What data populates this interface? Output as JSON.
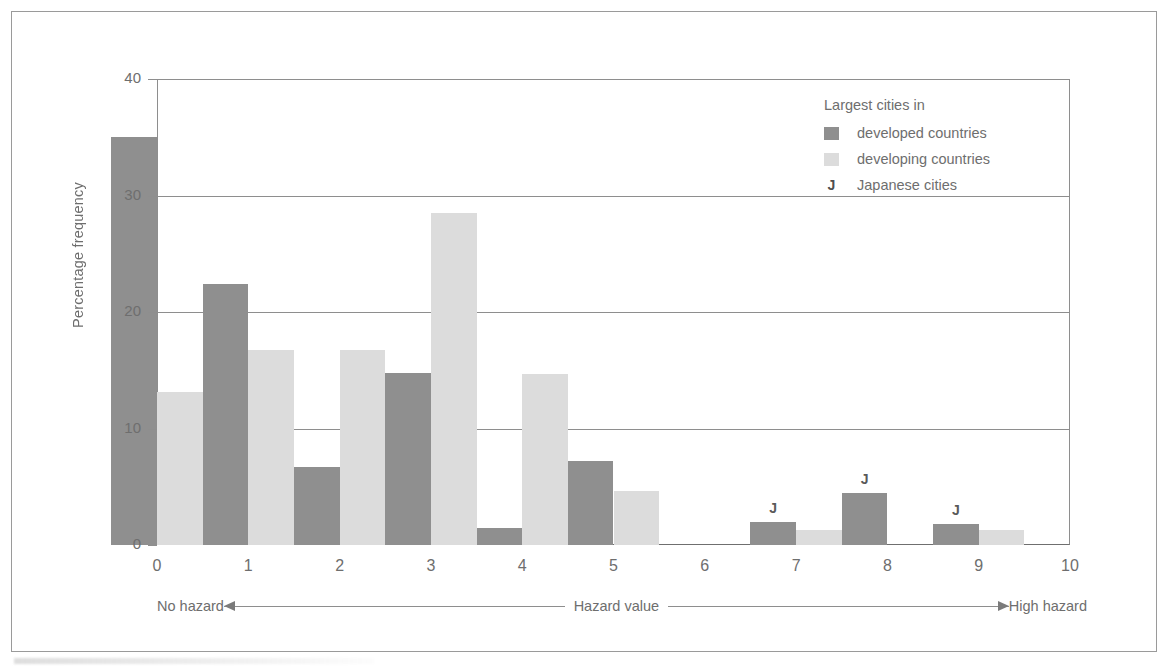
{
  "chart_data": {
    "type": "bar",
    "title": "",
    "xlabel": "Hazard value",
    "ylabel": "Percentage frequency",
    "categories": [
      "0",
      "1",
      "2",
      "3",
      "4",
      "5",
      "6",
      "7",
      "8",
      "9",
      "10"
    ],
    "xlim": [
      0,
      10
    ],
    "ylim": [
      0,
      40
    ],
    "yticks": [
      0,
      10,
      20,
      30,
      40
    ],
    "grid": "horizontal",
    "legend_position": "top-right",
    "series": [
      {
        "name": "developed countries",
        "color": "#8f8f8f",
        "values": [
          35.0,
          22.4,
          6.7,
          14.8,
          1.5,
          7.2,
          0,
          2.0,
          4.5,
          1.8,
          0
        ]
      },
      {
        "name": "developing countries",
        "color": "#dcdcdc",
        "values": [
          13.1,
          16.7,
          16.7,
          28.5,
          14.7,
          4.6,
          0,
          1.3,
          0,
          1.3,
          0
        ]
      }
    ],
    "annotations": [
      {
        "label": "J",
        "category": "7",
        "series": "developed countries"
      },
      {
        "label": "J",
        "category": "8",
        "series": "developed countries"
      },
      {
        "label": "J",
        "category": "9",
        "series": "developed countries"
      }
    ]
  },
  "axes": {
    "y_title": "Percentage frequency",
    "y_tick_labels": [
      "0",
      "10",
      "20",
      "30",
      "40"
    ],
    "x_tick_labels": [
      "0",
      "1",
      "2",
      "3",
      "4",
      "5",
      "6",
      "7",
      "8",
      "9",
      "10"
    ]
  },
  "legend": {
    "title": "Largest cities in",
    "entries": [
      {
        "swatch": "developed",
        "label": "developed countries"
      },
      {
        "swatch": "developing",
        "label": "developing countries"
      },
      {
        "swatch": "j",
        "label": "Japanese cities"
      }
    ],
    "j_glyph": "J"
  },
  "hazard_axis": {
    "left_label": "No hazard",
    "center_label": "Hazard value",
    "right_label": "High hazard"
  },
  "colors": {
    "developed": "#8f8f8f",
    "developing": "#dcdcdc",
    "axis": "#8e8e8e",
    "text": "#6e6e6e"
  }
}
